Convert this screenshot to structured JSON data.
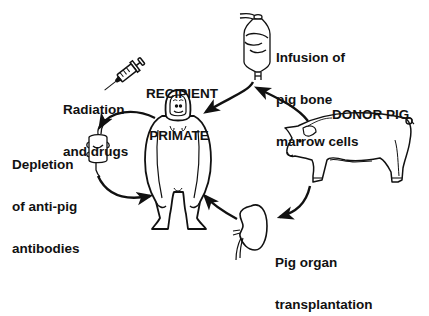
{
  "diagram": {
    "colors": {
      "ink": "#111111",
      "background": "#ffffff"
    },
    "nodes": {
      "recipient": {
        "title_lines": [
          "RECIPIENT",
          "PRIMATE"
        ]
      },
      "donor": {
        "title": "DONOR PIG"
      }
    },
    "steps": [
      {
        "id": "radiation",
        "icon": "syringe-icon",
        "lines": [
          "Radiation",
          "and drugs"
        ]
      },
      {
        "id": "depletion",
        "icon": "column-filter-icon",
        "lines": [
          "Depletion",
          "of anti-pig",
          "antibodies"
        ]
      },
      {
        "id": "infusion",
        "icon": "iv-bag-icon",
        "lines": [
          "Infusion of",
          "pig bone",
          "marrow cells"
        ]
      },
      {
        "id": "transplant",
        "icon": "kidney-icon",
        "lines": [
          "Pig organ",
          "transplantation"
        ]
      }
    ],
    "flows": [
      {
        "from": "recipient",
        "to": "depletion"
      },
      {
        "from": "depletion",
        "to": "recipient"
      },
      {
        "from": "donor",
        "to": "infusion"
      },
      {
        "from": "infusion",
        "to": "recipient"
      },
      {
        "from": "donor",
        "to": "transplant"
      },
      {
        "from": "transplant",
        "to": "recipient"
      },
      {
        "from": "radiation",
        "to": "recipient"
      }
    ]
  }
}
